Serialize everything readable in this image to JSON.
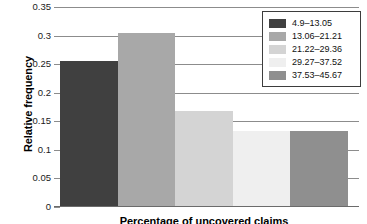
{
  "chart_data": {
    "type": "bar",
    "title": "",
    "xlabel": "Percentage of uncovered claims",
    "ylabel": "Relative frequency",
    "categories": [
      "4.9–13.05",
      "13.06–21.21",
      "21.22–29.36",
      "29.27–37.52",
      "37.53–45.67"
    ],
    "values": [
      0.253,
      0.303,
      0.166,
      0.132,
      0.132
    ],
    "ylim": [
      0,
      0.35
    ],
    "xlim": [
      0,
      5
    ],
    "ytick_labels": [
      "0",
      "0.05",
      "0.1",
      "0.15",
      "0.2",
      "0.25",
      "0.3",
      "0.35"
    ],
    "ytick_values": [
      0,
      0.05,
      0.1,
      0.15,
      0.2,
      0.25,
      0.3,
      0.35
    ],
    "xtick_labels": [],
    "grid": "horizontal",
    "legend_position": "top-right",
    "series": [
      {
        "name": "Relative frequency",
        "values": [
          0.253,
          0.303,
          0.166,
          0.132,
          0.132
        ]
      }
    ],
    "colors": [
      "#404040",
      "#a8a8a8",
      "#d4d4d4",
      "#efefef",
      "#8f8f8f"
    ]
  },
  "legend": {
    "items": [
      {
        "label": "4.9–13.05",
        "color": "#404040"
      },
      {
        "label": "13.06–21.21",
        "color": "#a8a8a8"
      },
      {
        "label": "21.22–29.36",
        "color": "#d4d4d4"
      },
      {
        "label": "29.27–37.52",
        "color": "#efefef"
      },
      {
        "label": "37.53–45.67",
        "color": "#8f8f8f"
      }
    ]
  },
  "axes": {
    "y_title": "Relative frequency",
    "x_title": "Percentage of uncovered claims",
    "y_ticks": [
      {
        "label": "0.35",
        "value": 0.35
      },
      {
        "label": "0.3",
        "value": 0.3
      },
      {
        "label": "0.25",
        "value": 0.25
      },
      {
        "label": "0.2",
        "value": 0.2
      },
      {
        "label": "0.15",
        "value": 0.15
      },
      {
        "label": "0.1",
        "value": 0.1
      },
      {
        "label": "0.05",
        "value": 0.05
      },
      {
        "label": "0",
        "value": 0
      }
    ]
  },
  "style": {
    "grid_color": "#8c8c8c",
    "axis_color": "#6b6b6b",
    "legend_border": "#3d3d3d",
    "background": "#ffffff"
  }
}
